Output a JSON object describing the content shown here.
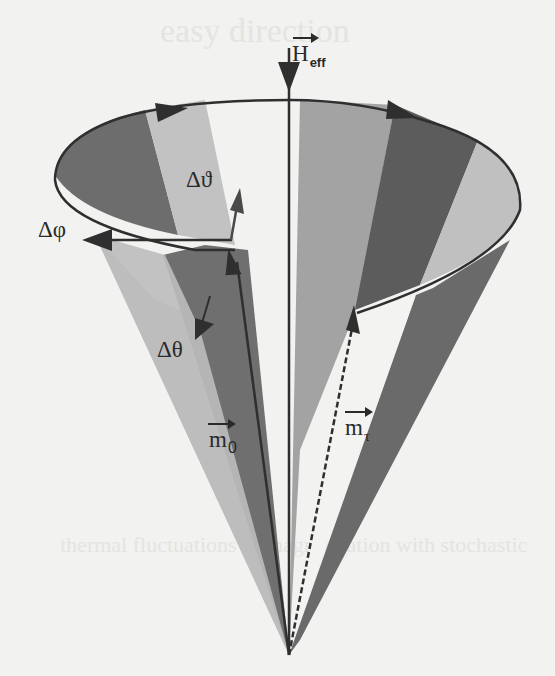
{
  "figure": {
    "colors": {
      "background": "#f2f2f0",
      "light_band": "#bdbdbd",
      "mid_band": "#a3a3a3",
      "dark_band": "#6d6d6d",
      "darkest_band": "#5c5c5c",
      "line": "#2f2f2f"
    }
  },
  "labels": {
    "field": {
      "symbol": "H",
      "subscript": "eff"
    },
    "delta_theta_var": "Δϑ",
    "delta_phi": "Δφ",
    "delta_theta": "Δθ",
    "m0": {
      "symbol": "m",
      "subscript": "0"
    },
    "mtau": {
      "symbol": "m",
      "subscript": "τ"
    }
  },
  "bleed_through": {
    "top": "easy direction",
    "bottom": "thermal fluctuations of magnetization with stochastic"
  }
}
